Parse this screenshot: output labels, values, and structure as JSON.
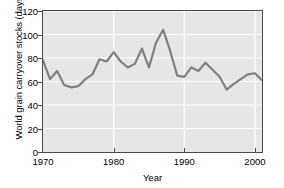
{
  "chart_data": {
    "type": "line",
    "title": "",
    "xlabel": "Year",
    "ylabel": "World grain carryover stocks (days)",
    "xlim": [
      1970,
      2001
    ],
    "ylim": [
      0,
      120
    ],
    "yticks": [
      0,
      20,
      40,
      60,
      80,
      100,
      120
    ],
    "xticks": [
      1970,
      1980,
      1990,
      2000
    ],
    "grid": true,
    "legend": "none",
    "line_color": "#808080",
    "plot_background": "#e6e6e6",
    "gridline_color": "#ffffff",
    "axis_color": "#4a4a4a",
    "x": [
      1970,
      1971,
      1972,
      1973,
      1974,
      1975,
      1976,
      1977,
      1978,
      1979,
      1980,
      1981,
      1982,
      1983,
      1984,
      1985,
      1986,
      1987,
      1988,
      1989,
      1990,
      1991,
      1992,
      1993,
      1994,
      1995,
      1996,
      1997,
      1998,
      1999,
      2000,
      2001
    ],
    "values": [
      78,
      62,
      69,
      57,
      55,
      56,
      62,
      66,
      79,
      77,
      85,
      77,
      72,
      75,
      88,
      72,
      93,
      104,
      86,
      65,
      64,
      72,
      69,
      76,
      70,
      64,
      53,
      58,
      62,
      66,
      67,
      61
    ],
    "series": [
      {
        "name": "World grain carryover stocks",
        "values": [
          78,
          62,
          69,
          57,
          55,
          56,
          62,
          66,
          79,
          77,
          85,
          77,
          72,
          75,
          88,
          72,
          93,
          104,
          86,
          65,
          64,
          72,
          69,
          76,
          70,
          64,
          53,
          58,
          62,
          66,
          67,
          61
        ]
      }
    ]
  }
}
